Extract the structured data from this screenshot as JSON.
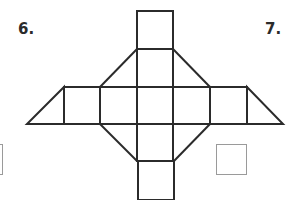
{
  "problems": [
    {
      "number_label": "6.",
      "answer_box": "empty"
    },
    {
      "number_label": "7.",
      "answer_box": "empty"
    }
  ],
  "figure": {
    "type": "polyhedron net",
    "stroke_color": "#2b2b2b",
    "answer_box_color": "#9a9a9a",
    "squares": 9,
    "triangles": 6
  }
}
